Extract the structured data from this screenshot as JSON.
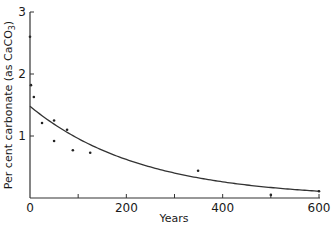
{
  "chart_data": {
    "type": "scatter",
    "title": "",
    "xlabel": "Years",
    "ylabel": "Per cent carbonate (as CaCO3)",
    "ylabel_main": "Per cent carbonate (as CaCO",
    "ylabel_sub": "3",
    "ylabel_end": ")",
    "xlim": [
      0,
      600
    ],
    "ylim": [
      0,
      3
    ],
    "x_ticks": [
      0,
      100,
      200,
      300,
      400,
      500,
      600
    ],
    "x_tick_labels": [
      "0",
      "",
      "200",
      "",
      "400",
      "",
      "600"
    ],
    "y_ticks": [
      0,
      1,
      2,
      3
    ],
    "y_tick_labels": [
      "",
      "1",
      "2",
      "3"
    ],
    "x_origin_label": "0",
    "grid": false,
    "legend": null,
    "series": [
      {
        "name": "observations",
        "kind": "points",
        "points": [
          {
            "x": 0,
            "y": 2.6
          },
          {
            "x": 2,
            "y": 1.82
          },
          {
            "x": 8,
            "y": 1.63
          },
          {
            "x": 25,
            "y": 1.21
          },
          {
            "x": 50,
            "y": 1.25
          },
          {
            "x": 50,
            "y": 0.92
          },
          {
            "x": 77,
            "y": 1.1
          },
          {
            "x": 89,
            "y": 0.77
          },
          {
            "x": 125,
            "y": 0.73
          },
          {
            "x": 349,
            "y": 0.44
          },
          {
            "x": 500,
            "y": 0.05
          },
          {
            "x": 600,
            "y": 0.11
          }
        ]
      },
      {
        "name": "fitted exponential decay",
        "kind": "curve",
        "model": "y = 1.48 * exp(-0.00434 * x)",
        "a": 1.48,
        "k": 0.00434
      }
    ]
  }
}
